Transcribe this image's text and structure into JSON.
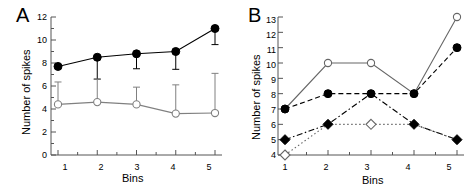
{
  "figure": {
    "background": "#ffffff",
    "panels": [
      "A",
      "B"
    ]
  },
  "panel_a": {
    "label": "A",
    "ylabel": "Number of spikes",
    "xlabel": "Bins",
    "ytick_labels": [
      "0",
      "2",
      "4",
      "6",
      "8",
      "10",
      "12"
    ],
    "xtick_labels": [
      "1",
      "2",
      "3",
      "4",
      "5"
    ]
  },
  "panel_b": {
    "label": "B",
    "ylabel": "Number of spikes",
    "xlabel": "Bins",
    "ytick_labels": [
      "4",
      "5",
      "6",
      "7",
      "8",
      "9",
      "10",
      "11",
      "12",
      "13"
    ],
    "xtick_labels": [
      "1",
      "2",
      "3",
      "4",
      "5"
    ]
  },
  "chart_data": [
    {
      "type": "line",
      "panel": "A",
      "title": "A",
      "xlabel": "Bins",
      "ylabel": "Number of spikes",
      "x": [
        1,
        2,
        3,
        4,
        5
      ],
      "xtick_labels": [
        "1",
        "2",
        "3",
        "4",
        "5"
      ],
      "ytick_labels": [
        "0",
        "2",
        "4",
        "6",
        "8",
        "10",
        "12"
      ],
      "xlim": [
        0.55,
        5.45
      ],
      "ylim": [
        0,
        12
      ],
      "grid": false,
      "legend": "none",
      "error_bars": true,
      "series": [
        {
          "name": "filled-circle-series",
          "marker": "filled-circle",
          "line_style": "solid",
          "color": "#000000",
          "values": [
            7.7,
            8.5,
            8.8,
            9.0,
            11.0
          ],
          "err_low": [
            7.7,
            6.6,
            7.5,
            7.45,
            9.6
          ],
          "err_high": [
            7.7,
            8.5,
            8.8,
            9.0,
            11.0
          ]
        },
        {
          "name": "open-circle-series",
          "marker": "open-circle",
          "line_style": "solid",
          "color": "#808080",
          "values": [
            4.4,
            4.6,
            4.4,
            3.6,
            3.65
          ],
          "err_low": [
            4.4,
            4.6,
            4.4,
            3.6,
            3.65
          ],
          "err_high": [
            6.35,
            6.6,
            5.9,
            6.1,
            7.1
          ]
        }
      ]
    },
    {
      "type": "line",
      "panel": "B",
      "title": "B",
      "xlabel": "Bins",
      "ylabel": "Number of spikes",
      "x": [
        1,
        2,
        3,
        4,
        5
      ],
      "xtick_labels": [
        "1",
        "2",
        "3",
        "4",
        "5"
      ],
      "ytick_labels": [
        "4",
        "5",
        "6",
        "7",
        "8",
        "9",
        "10",
        "11",
        "12",
        "13"
      ],
      "xlim": [
        0.55,
        5.45
      ],
      "ylim": [
        4,
        13
      ],
      "grid": false,
      "legend": "none",
      "error_bars": false,
      "series": [
        {
          "name": "open-circle-series",
          "marker": "open-circle",
          "line_style": "solid",
          "color": "#666666",
          "values": [
            7,
            10,
            10,
            8,
            13
          ]
        },
        {
          "name": "filled-circle-series",
          "marker": "filled-circle",
          "line_style": "dashed",
          "color": "#000000",
          "values": [
            7,
            8,
            8,
            8,
            11
          ]
        },
        {
          "name": "filled-diamond-series",
          "marker": "filled-diamond",
          "line_style": "dashdot",
          "color": "#000000",
          "values": [
            5,
            6,
            8,
            6,
            5
          ]
        },
        {
          "name": "open-diamond-series",
          "marker": "open-diamond",
          "line_style": "dotted",
          "color": "#666666",
          "values": [
            4,
            6,
            6,
            6,
            5
          ]
        }
      ]
    }
  ]
}
